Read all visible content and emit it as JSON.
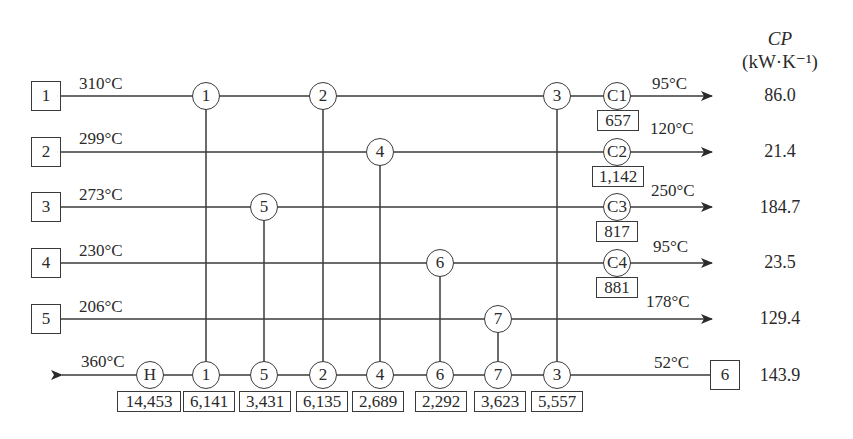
{
  "header": {
    "cp_label": "CP",
    "cp_unit": "(kW·K⁻¹)"
  },
  "streams": [
    {
      "id": "1",
      "type": "hot",
      "supply_temp": "310°C",
      "target_temp": "95°C",
      "cp": "86.0",
      "cooler": "C1",
      "cooler_duty": "657"
    },
    {
      "id": "2",
      "type": "hot",
      "supply_temp": "299°C",
      "target_temp": "120°C",
      "cp": "21.4",
      "cooler": "C2",
      "cooler_duty": "1,142"
    },
    {
      "id": "3",
      "type": "hot",
      "supply_temp": "273°C",
      "target_temp": "250°C",
      "cp": "184.7",
      "cooler": "C3",
      "cooler_duty": "817"
    },
    {
      "id": "4",
      "type": "hot",
      "supply_temp": "230°C",
      "target_temp": "95°C",
      "cp": "23.5",
      "cooler": "C4",
      "cooler_duty": "881"
    },
    {
      "id": "5",
      "type": "hot",
      "supply_temp": "206°C",
      "target_temp": "178°C",
      "cp": "129.4"
    },
    {
      "id": "6",
      "type": "cold",
      "supply_temp": "52°C",
      "target_temp": "360°C",
      "cp": "143.9",
      "heater": "H",
      "heater_duty": "14,453"
    }
  ],
  "exchangers": [
    {
      "id": "1",
      "hot_stream": "1",
      "duty": "6,141"
    },
    {
      "id": "5",
      "hot_stream": "3",
      "duty": "3,431"
    },
    {
      "id": "2",
      "hot_stream": "1",
      "duty": "6,135"
    },
    {
      "id": "4",
      "hot_stream": "2",
      "duty": "2,689"
    },
    {
      "id": "6",
      "hot_stream": "4",
      "duty": "2,292"
    },
    {
      "id": "7",
      "hot_stream": "5",
      "duty": "3,623"
    },
    {
      "id": "3",
      "hot_stream": "1",
      "duty": "5,557"
    }
  ],
  "colors": {
    "line": "#3a3a3a",
    "text": "#2a2a2a",
    "background": "#ffffff"
  }
}
